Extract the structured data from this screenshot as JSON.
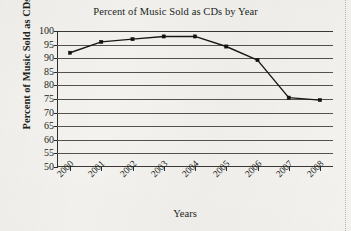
{
  "chart_data": {
    "type": "line",
    "title": "Percent of Music Sold as CDs by Year",
    "xlabel": "Years",
    "ylabel": "Percent of Music Sold as CDs",
    "categories": [
      "2000",
      "2001",
      "2002",
      "2003",
      "2004",
      "2005",
      "2006",
      "2007",
      "2008"
    ],
    "values": [
      92,
      96,
      97,
      98,
      98,
      94.3,
      89.3,
      75.5,
      74.6
    ],
    "series": [
      {
        "name": "Percent of Music Sold as CDs",
        "values": [
          92,
          96,
          97,
          98,
          98,
          94.3,
          89.3,
          75.5,
          74.6
        ]
      }
    ],
    "ylim": [
      50,
      100
    ],
    "ytick_labels": [
      "100",
      "95",
      "90",
      "85",
      "80",
      "75",
      "70",
      "65",
      "60",
      "55",
      "50"
    ],
    "ytick_values": [
      100,
      95,
      90,
      85,
      80,
      75,
      70,
      65,
      60,
      55,
      50
    ],
    "ytick_step": 5,
    "xtick_labels": [
      "2000",
      "2001",
      "2002",
      "2003",
      "2004",
      "2005",
      "2006",
      "2007",
      "2008"
    ],
    "grid": "horizontal",
    "legend": "none",
    "marker": "square",
    "line_color": "#1b1916",
    "grid_color": "#55524e",
    "background_color": "#f3f2ee"
  }
}
